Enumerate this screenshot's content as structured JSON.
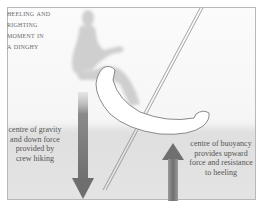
{
  "diagram": {
    "title_lines": [
      "Heeling and",
      "righting",
      "moment in",
      "a dinghy"
    ],
    "labels": {
      "gravity": [
        "centre of gravity",
        "and down force",
        "provided by",
        "crew hiking"
      ],
      "buoyancy": [
        "centre of buoyancy",
        "provides upward",
        "force and resistance",
        "to heeling"
      ]
    },
    "elements": {
      "crew_silhouette": "seated crew figure hiking out",
      "hull": "dinghy hull cross-section, heeled",
      "mast": "mast and centreboard line",
      "down_arrow": "centre of gravity down force",
      "up_arrow": "centre of buoyancy upward force"
    },
    "colors": {
      "arrow": "#7a7a7a",
      "silhouette": "#cfcfcf",
      "hull_fill": "#ffffff",
      "hull_stroke": "#8a8a8a",
      "frame": "#b8b8b8",
      "text": "#555555"
    }
  }
}
